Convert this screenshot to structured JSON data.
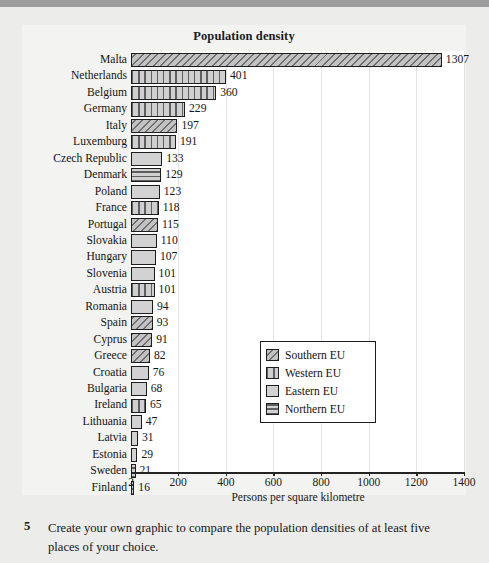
{
  "chart_data": {
    "type": "bar",
    "orientation": "horizontal",
    "title": "Population density",
    "xlabel": "Persons per square kilometre",
    "ylabel": "",
    "xlim": [
      2,
      1400
    ],
    "xticks": [
      2,
      200,
      400,
      600,
      800,
      1000,
      1200,
      1400
    ],
    "xticklabels": [
      "2",
      "200",
      "400",
      "600",
      "800",
      "1000",
      "1200",
      "1400"
    ],
    "grid": true,
    "legend_position": "center-right",
    "categories": [
      "Malta",
      "Netherlands",
      "Belgium",
      "Germany",
      "Italy",
      "Luxemburg",
      "Czech Republic",
      "Denmark",
      "Poland",
      "France",
      "Portugal",
      "Slovakia",
      "Hungary",
      "Slovenia",
      "Austria",
      "Romania",
      "Spain",
      "Cyprus",
      "Greece",
      "Croatia",
      "Bulgaria",
      "Ireland",
      "Lithuania",
      "Latvia",
      "Estonia",
      "Sweden",
      "Finland"
    ],
    "values": [
      1307,
      401,
      360,
      229,
      197,
      191,
      133,
      129,
      123,
      118,
      115,
      110,
      107,
      101,
      101,
      94,
      93,
      91,
      82,
      76,
      68,
      65,
      47,
      31,
      29,
      21,
      16
    ],
    "groups": [
      "Southern EU",
      "Western EU",
      "Western EU",
      "Western EU",
      "Southern EU",
      "Western EU",
      "Eastern EU",
      "Northern EU",
      "Eastern EU",
      "Western EU",
      "Southern EU",
      "Eastern EU",
      "Eastern EU",
      "Eastern EU",
      "Western EU",
      "Eastern EU",
      "Southern EU",
      "Southern EU",
      "Southern EU",
      "Eastern EU",
      "Eastern EU",
      "Western EU",
      "Eastern EU",
      "Eastern EU",
      "Eastern EU",
      "Northern EU",
      "Northern EU"
    ],
    "legend": [
      {
        "label": "Southern EU",
        "pattern": "diagonal-hatch",
        "color": "#a8a8a8"
      },
      {
        "label": "Western EU",
        "pattern": "vertical-lines",
        "color": "#c4c4c4"
      },
      {
        "label": "Eastern EU",
        "pattern": "solid-light",
        "color": "#d2d2d2"
      },
      {
        "label": "Northern EU",
        "pattern": "horizontal-lines",
        "color": "#c4c4c4"
      }
    ]
  },
  "exercise": {
    "number": "5",
    "text": "Create your own graphic to compare the population densities of at least five places of your choice."
  }
}
